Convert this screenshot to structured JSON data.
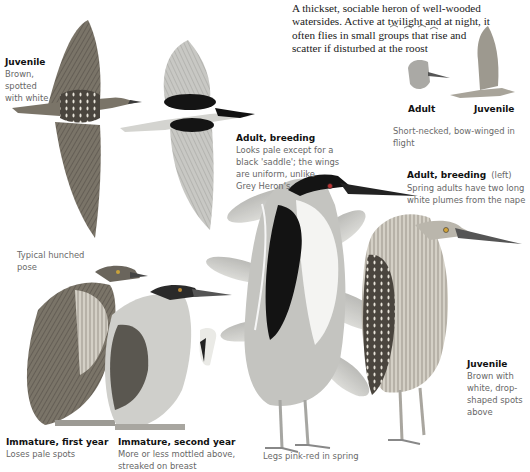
{
  "intro": {
    "text": "A thickset, sociable heron of well-wooded watersides. Active at twilight and at night, it often flies in small groups that rise and scatter if disturbed at the roost"
  },
  "flight_juvenile": {
    "title": "Juvenile",
    "lines": [
      "Brown,",
      "spotted",
      "with white"
    ]
  },
  "flight_adult_breeding": {
    "title": "Adult, breeding",
    "lines": [
      "Looks pale except for a",
      "black 'saddle'; the wings",
      "are uniform, unlike",
      "Grey Heron's"
    ]
  },
  "small_flight": {
    "adult_label": "Adult",
    "juvenile_label": "Juvenile",
    "caption": "Short-necked, bow-winged in flight"
  },
  "standing_adult_breeding": {
    "title": "Adult, breeding",
    "title_suffix": "(left)",
    "lines": [
      "Spring adults have two long",
      "white plumes from the nape"
    ]
  },
  "pose_note": {
    "lines": [
      "Typical hunched",
      "pose"
    ]
  },
  "standing_juvenile": {
    "title": "Juvenile",
    "lines": [
      "Brown with",
      "white, drop-",
      "shaped spots",
      "above"
    ]
  },
  "immature_first": {
    "title": "Immature, first year",
    "lines": [
      "Loses pale spots"
    ]
  },
  "immature_second": {
    "title": "Immature, second year",
    "lines": [
      "More or less mottled above,",
      "streaked on breast"
    ]
  },
  "legs_note": {
    "text": "Legs pink-red in spring"
  },
  "colors": {
    "ink": "#111111",
    "caption_grey": "#666666",
    "juvenile_brown": "#6e6658",
    "adult_black": "#151515",
    "adult_grey": "#b9b9b6"
  }
}
